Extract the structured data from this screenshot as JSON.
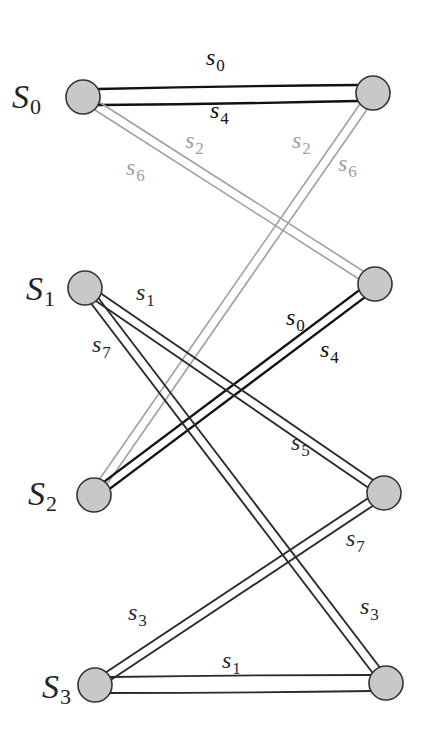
{
  "colors": {
    "dark": "#2a2a2a",
    "black": "#111111",
    "gray": "#a0a0a0",
    "node_fill": "#c8c8c8",
    "node_stroke": "#333333"
  },
  "states": [
    {
      "name": "S",
      "sub": "0",
      "x": 12,
      "y": 108
    },
    {
      "name": "S",
      "sub": "1",
      "x": 26,
      "y": 300
    },
    {
      "name": "S",
      "sub": "2",
      "x": 28,
      "y": 505
    },
    {
      "name": "S",
      "sub": "3",
      "x": 42,
      "y": 698
    }
  ],
  "left_nodes": [
    {
      "id": "L0",
      "cx": 83,
      "cy": 97
    },
    {
      "id": "L1",
      "cx": 85,
      "cy": 288
    },
    {
      "id": "L2",
      "cx": 94,
      "cy": 495
    },
    {
      "id": "L3",
      "cx": 95,
      "cy": 685
    }
  ],
  "right_nodes": [
    {
      "id": "R0",
      "cx": 373,
      "cy": 93
    },
    {
      "id": "R1",
      "cx": 375,
      "cy": 284
    },
    {
      "id": "R2",
      "cx": 384,
      "cy": 493
    },
    {
      "id": "R3",
      "cx": 386,
      "cy": 683
    }
  ],
  "edges": [
    {
      "from": "L0",
      "to": "R0",
      "color": "black",
      "labels": [
        "s0",
        "s4"
      ]
    },
    {
      "from": "L0",
      "to": "R1",
      "color": "gray",
      "labels": [
        "s2",
        "s6"
      ]
    },
    {
      "from": "L2",
      "to": "R0",
      "color": "gray",
      "labels": [
        "s2",
        "s6"
      ]
    },
    {
      "from": "L2",
      "to": "R1",
      "color": "black",
      "labels": [
        "s0",
        "s4"
      ]
    },
    {
      "from": "L1",
      "to": "R2",
      "color": "dark",
      "labels": [
        "s1",
        "s5"
      ]
    },
    {
      "from": "L1",
      "to": "R3",
      "color": "dark",
      "labels": [
        "s7",
        "s3"
      ]
    },
    {
      "from": "L3",
      "to": "R2",
      "color": "dark",
      "labels": [
        "s3",
        "s7"
      ]
    },
    {
      "from": "L3",
      "to": "R3",
      "color": "dark",
      "labels": [
        "s1"
      ]
    }
  ],
  "edge_labels": [
    {
      "base": "s",
      "sub": "0",
      "x": 206,
      "y": 65,
      "color": "black"
    },
    {
      "base": "s",
      "sub": "4",
      "x": 210,
      "y": 118,
      "color": "black"
    },
    {
      "base": "s",
      "sub": "2",
      "x": 185,
      "y": 148,
      "color": "gray"
    },
    {
      "base": "s",
      "sub": "6",
      "x": 126,
      "y": 175,
      "color": "gray"
    },
    {
      "base": "s",
      "sub": "2",
      "x": 292,
      "y": 148,
      "color": "gray"
    },
    {
      "base": "s",
      "sub": "6",
      "x": 338,
      "y": 171,
      "color": "gray"
    },
    {
      "base": "s",
      "sub": "1",
      "x": 136,
      "y": 300,
      "color": "dark"
    },
    {
      "base": "s",
      "sub": "7",
      "x": 92,
      "y": 352,
      "color": "dark"
    },
    {
      "base": "s",
      "sub": "0",
      "x": 286,
      "y": 325,
      "color": "black"
    },
    {
      "base": "s",
      "sub": "4",
      "x": 320,
      "y": 357,
      "color": "black"
    },
    {
      "base": "s",
      "sub": "5",
      "x": 291,
      "y": 450,
      "color": "dark"
    },
    {
      "base": "s",
      "sub": "7",
      "x": 346,
      "y": 546,
      "color": "dark"
    },
    {
      "base": "s",
      "sub": "3",
      "x": 128,
      "y": 620,
      "color": "dark"
    },
    {
      "base": "s",
      "sub": "3",
      "x": 360,
      "y": 614,
      "color": "dark"
    },
    {
      "base": "s",
      "sub": "1",
      "x": 222,
      "y": 668,
      "color": "dark"
    }
  ]
}
